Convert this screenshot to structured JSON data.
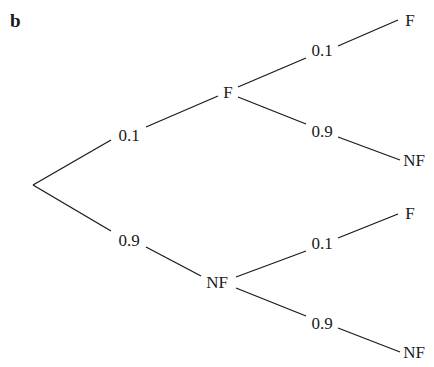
{
  "part_label": "b",
  "tree": {
    "root": {
      "x": 33,
      "y": 185
    },
    "level1": [
      {
        "id": "F",
        "label": "F",
        "prob": "0.1",
        "node": {
          "x": 228,
          "y": 98
        },
        "prob_pos": {
          "x": 129,
          "y": 141
        },
        "children": [
          {
            "label": "F",
            "prob": "0.1",
            "node": {
              "x": 410,
              "y": 26
            },
            "prob_pos": {
              "x": 322,
              "y": 56
            }
          },
          {
            "label": "NF",
            "prob": "0.9",
            "node": {
              "x": 414,
              "y": 166
            },
            "prob_pos": {
              "x": 322,
              "y": 137
            }
          }
        ]
      },
      {
        "id": "NF",
        "label": "NF",
        "prob": "0.9",
        "node": {
          "x": 217,
          "y": 288
        },
        "prob_pos": {
          "x": 129,
          "y": 246
        },
        "children": [
          {
            "label": "F",
            "prob": "0.1",
            "node": {
              "x": 410,
              "y": 219
            },
            "prob_pos": {
              "x": 322,
              "y": 249
            }
          },
          {
            "label": "NF",
            "prob": "0.9",
            "node": {
              "x": 414,
              "y": 358
            },
            "prob_pos": {
              "x": 322,
              "y": 329
            }
          }
        ]
      }
    ]
  },
  "colors": {
    "ink": "#1a1a1a",
    "background": "#ffffff"
  }
}
